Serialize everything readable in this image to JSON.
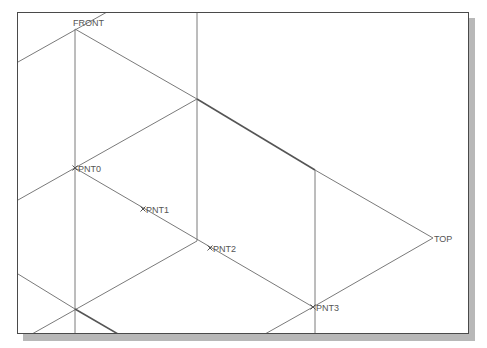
{
  "viewport": {
    "frame_color": "#4a4a4a",
    "shadow_color": "#b8b8b8",
    "line_color": "#7a7a7a",
    "edge_color": "#555555"
  },
  "datum_planes": [
    {
      "label": "FRONT",
      "x": 75,
      "y": 29
    },
    {
      "label": "TOP",
      "x": 433,
      "y": 238
    }
  ],
  "datum_points": [
    {
      "label": "PNT0",
      "x": 75,
      "y": 168
    },
    {
      "label": "PNT1",
      "x": 143,
      "y": 209
    },
    {
      "label": "PNT2",
      "x": 210,
      "y": 248
    },
    {
      "label": "PNT3",
      "x": 313,
      "y": 307
    }
  ],
  "lines": [
    {
      "x1": 18,
      "y1": 62,
      "x2": 107,
      "y2": 12
    },
    {
      "x1": 75,
      "y1": 29,
      "x2": 197,
      "y2": 99
    },
    {
      "x1": 75,
      "y1": 29,
      "x2": 75,
      "y2": 334
    },
    {
      "x1": 197,
      "y1": 12,
      "x2": 197,
      "y2": 241
    },
    {
      "x1": 197,
      "y1": 99,
      "x2": 315,
      "y2": 170,
      "emph": true
    },
    {
      "x1": 315,
      "y1": 170,
      "x2": 433,
      "y2": 238
    },
    {
      "x1": 197,
      "y1": 99,
      "x2": 18,
      "y2": 200
    },
    {
      "x1": 75,
      "y1": 168,
      "x2": 313,
      "y2": 307
    },
    {
      "x1": 315,
      "y1": 170,
      "x2": 315,
      "y2": 334
    },
    {
      "x1": 433,
      "y1": 238,
      "x2": 313,
      "y2": 307
    },
    {
      "x1": 313,
      "y1": 307,
      "x2": 265,
      "y2": 334
    },
    {
      "x1": 197,
      "y1": 241,
      "x2": 32,
      "y2": 334
    },
    {
      "x1": 18,
      "y1": 274,
      "x2": 75,
      "y2": 309
    },
    {
      "x1": 75,
      "y1": 309,
      "x2": 118,
      "y2": 334,
      "emph": true
    }
  ]
}
